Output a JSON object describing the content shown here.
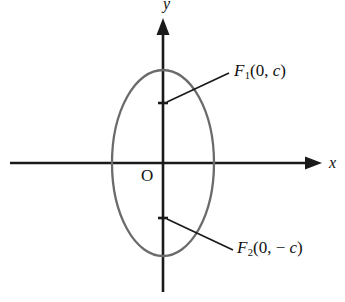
{
  "figure": {
    "type": "coordinate-diagram",
    "background_color": "#ffffff",
    "axis_color": "#1a1a1a",
    "curve_color": "#6b6b6b",
    "leader_color": "#1a1a1a"
  },
  "axes": {
    "x_label": "x",
    "y_label": "y",
    "origin_label": "O",
    "x_axis": {
      "start_x": 10,
      "end_x": 322,
      "y": 163
    },
    "y_axis": {
      "x": 163,
      "start_y": 18,
      "end_y": 292
    }
  },
  "ellipse": {
    "center_x": 163,
    "center_y": 163,
    "semi_axis_x": 51,
    "semi_axis_y": 93
  },
  "foci": [
    {
      "id": "F1",
      "label_prefix": "F",
      "label_subscript": "1",
      "label_open_paren": "(",
      "label_x_value": "0",
      "label_separator": ", ",
      "label_y_value": "c",
      "label_close_paren": ")",
      "label_full": "F1(0, c)",
      "point_x": 163,
      "point_y": 103,
      "tick_half_width": 5,
      "leader_from_x": 167,
      "leader_from_y": 102,
      "leader_to_x": 229,
      "leader_to_y": 73
    },
    {
      "id": "F2",
      "label_prefix": "F",
      "label_subscript": "2",
      "label_open_paren": "(",
      "label_x_value": "0",
      "label_separator": ", ",
      "label_minus": "− ",
      "label_y_value": "c",
      "label_close_paren": ")",
      "label_full": "F2(0, − c)",
      "point_x": 163,
      "point_y": 218,
      "tick_half_width": 5,
      "leader_from_x": 167,
      "leader_from_y": 219,
      "leader_to_x": 233,
      "leader_to_y": 250
    }
  ]
}
